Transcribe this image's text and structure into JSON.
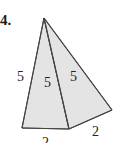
{
  "problem": {
    "number": "4."
  },
  "figure": {
    "type": "pyramid-net-view",
    "colors": {
      "face_fill": "#e4e4e4",
      "stroke": "#444444",
      "background": "#ffffff"
    },
    "labels": {
      "left_edge": "5",
      "middle_edge": "5",
      "right_face": "5",
      "bottom_front": "2",
      "bottom_right": "2"
    }
  }
}
